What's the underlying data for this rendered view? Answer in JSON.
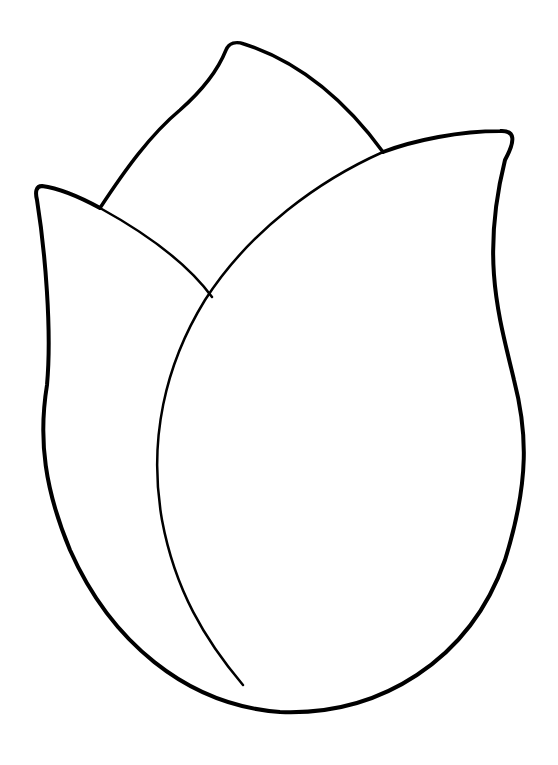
{
  "image": {
    "subject": "tulip bud coloring page outline",
    "background": "#ffffff",
    "stroke_color": "#000000",
    "parts": [
      "back-petal",
      "left-petal",
      "right-petal",
      "center-fold-line"
    ]
  }
}
